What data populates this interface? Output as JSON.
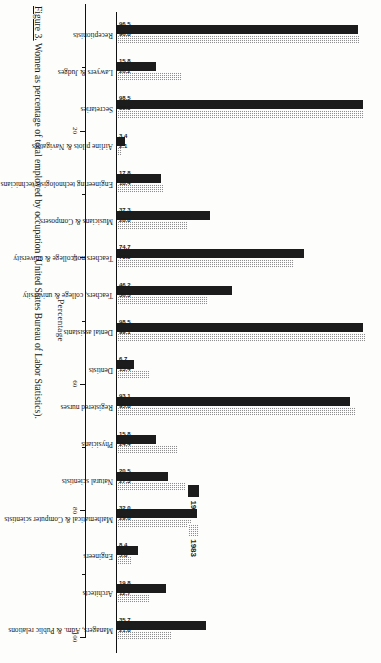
{
  "chart_data": {
    "type": "bar",
    "title": "",
    "xlabel": "",
    "ylabel": "Percentage",
    "ylim": [
      0,
      100
    ],
    "grid": false,
    "legend_position": "center-right",
    "orientation": "vertical-bars-rotated-page",
    "categories": [
      "Receptionists",
      "Lawyers & Judges",
      "Secretaries",
      "Airline pilots & Navigators",
      "Engineering technologists/technicians",
      "Musicians & Composers",
      "Teachers not college & university",
      "Teachers, college & university",
      "Dental assistants",
      "Dentists",
      "Registered nurses",
      "Physicians",
      "Natural scientists",
      "Mathematical & Computer scientists",
      "Engineers",
      "Architects",
      "Managers, Adm. & Public relations"
    ],
    "series": [
      {
        "name": "1995",
        "color": "#1c1c1c",
        "values": [
          96.5,
          15.8,
          98.5,
          3.4,
          17.8,
          37.3,
          74.7,
          46.2,
          98.5,
          6.7,
          93.1,
          15.8,
          20.5,
          32.0,
          8.4,
          19.8,
          35.7
        ]
      },
      {
        "name": "1983",
        "color": "#8e8e8e",
        "values": [
          96.8,
          26.2,
          99.0,
          2.1,
          18.4,
          28.0,
          70.9,
          36.3,
          99.1,
          13.4,
          95.8,
          24.4,
          27.3,
          29.6,
          5.8,
          12.7,
          21.8
        ]
      }
    ],
    "tick_labels": [
      "20",
      "40",
      "60",
      "80",
      "100"
    ],
    "tick_values": [
      20,
      40,
      60,
      80,
      100
    ],
    "minor_tick_values": [
      10,
      30,
      50,
      70,
      90
    ]
  },
  "legend": {
    "entries": [
      {
        "label": "1995",
        "swatch": "solid-black-swatch"
      },
      {
        "label": "1983",
        "swatch": "hatched-gray-swatch"
      }
    ]
  },
  "axis": {
    "title": "Percentage"
  },
  "caption": {
    "figure_number": "Figure 3.",
    "text": "Women as percentage of total employed by occupation (United States Bureau of Labor Statistics)."
  }
}
